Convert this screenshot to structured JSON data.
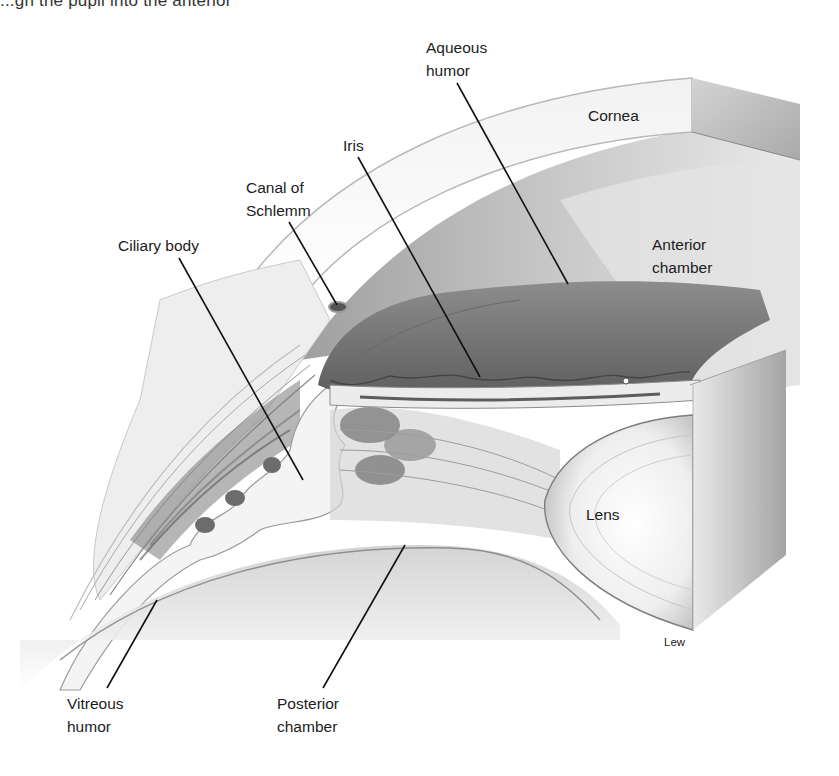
{
  "caption": {
    "partial_text": "...gh the pupil into the anterior"
  },
  "figure": {
    "labels": [
      {
        "id": "aqueous-humor",
        "lines": [
          "Aqueous",
          "humor"
        ]
      },
      {
        "id": "cornea",
        "lines": [
          "Cornea"
        ]
      },
      {
        "id": "iris",
        "lines": [
          "Iris"
        ]
      },
      {
        "id": "canal-of-schlemm",
        "lines": [
          "Canal of",
          "Schlemm"
        ]
      },
      {
        "id": "ciliary-body",
        "lines": [
          "Ciliary body"
        ]
      },
      {
        "id": "anterior-chamber",
        "lines": [
          "Anterior",
          "chamber"
        ]
      },
      {
        "id": "lens",
        "lines": [
          "Lens"
        ]
      },
      {
        "id": "vitreous-humor",
        "lines": [
          "Vitreous",
          "humor"
        ]
      },
      {
        "id": "posterior-chamber",
        "lines": [
          "Posterior",
          "chamber"
        ]
      }
    ],
    "signature": "Lew"
  }
}
